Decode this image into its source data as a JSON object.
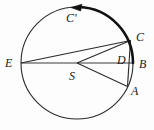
{
  "figure": {
    "width": 154,
    "height": 130,
    "background_color": "#fdfdfd",
    "stroke_color": "#1a1a1a",
    "thick_arc_color": "#111111"
  },
  "labels": {
    "E": "E",
    "B": "B",
    "C": "C",
    "A": "A",
    "D": "D",
    "S": "S",
    "C_prime": "C'"
  },
  "geometry": {
    "circle": {
      "cx": 77,
      "cy": 63,
      "r": 56
    },
    "points": {
      "S": {
        "x": 77,
        "y": 63
      },
      "E": {
        "x": 21,
        "y": 63
      },
      "B": {
        "x": 133,
        "y": 63
      },
      "C": {
        "x": 130.5,
        "y": 40.5
      },
      "A": {
        "x": 127.5,
        "y": 86.5
      },
      "D": {
        "x": 126,
        "y": 63
      },
      "C_prime_arrow": {
        "x": 78,
        "y": 7
      }
    },
    "segments": [
      {
        "name": "E-B-diameter",
        "from": "E",
        "to": "B"
      },
      {
        "name": "E-C-chord",
        "from": "E",
        "to": "C"
      },
      {
        "name": "S-C-radius",
        "from": "S",
        "to": "C"
      },
      {
        "name": "S-A-radius",
        "from": "S",
        "to": "A"
      },
      {
        "name": "C-A-chord",
        "from": "C",
        "to": "A"
      }
    ],
    "arcs": [
      {
        "name": "main-circle",
        "kind": "full-circle",
        "stroke_width": 1
      },
      {
        "name": "marked-arc-C-to-B",
        "kind": "thick-arc",
        "from_angle_deg": -92,
        "to_angle_deg": 0,
        "stroke_width": 2.4,
        "arrow_at": "start",
        "arrow_direction": "counterclockwise"
      }
    ]
  }
}
